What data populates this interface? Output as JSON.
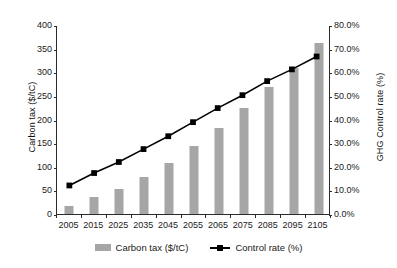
{
  "chart_data": {
    "type": "bar",
    "title": "",
    "subtitle": "",
    "xlabel": "",
    "ylabel": "Carbon tax ($/tC)",
    "y2label": "GHG Control rate (%)",
    "categories": [
      "2005",
      "2015",
      "2025",
      "2035",
      "2045",
      "2055",
      "2065",
      "2075",
      "2085",
      "2095",
      "2105"
    ],
    "ylim": [
      0,
      400
    ],
    "y2lim": [
      0,
      80
    ],
    "yticks": [
      "0",
      "50",
      "100",
      "150",
      "200",
      "250",
      "300",
      "350",
      "400"
    ],
    "ytick_values": [
      0,
      50,
      100,
      150,
      200,
      250,
      300,
      350,
      400
    ],
    "y2ticks": [
      "0.0%",
      "10.0%",
      "20.0%",
      "30.0%",
      "40.0%",
      "50.0%",
      "60.0%",
      "70.0%",
      "80.0%"
    ],
    "y2tick_values": [
      0,
      10,
      20,
      30,
      40,
      50,
      60,
      70,
      80
    ],
    "grid": false,
    "legend_position": "bottom",
    "series": [
      {
        "name": "Carbon tax ($/tC)",
        "type": "bar",
        "axis": "left",
        "color": "#a6a6a6",
        "values": [
          18,
          35,
          53,
          78,
          108,
          143,
          183,
          225,
          268,
          308,
          362
        ]
      },
      {
        "name": "Control rate (%)",
        "type": "line",
        "axis": "right",
        "color": "#000000",
        "marker": "square",
        "values": [
          12.0,
          17.3,
          22.0,
          27.5,
          33.0,
          39.0,
          45.0,
          50.5,
          56.5,
          61.5,
          67.0
        ]
      }
    ]
  },
  "legend": {
    "entries": [
      {
        "label": "Carbon tax ($/tC)"
      },
      {
        "label": "Control rate (%)"
      }
    ]
  }
}
